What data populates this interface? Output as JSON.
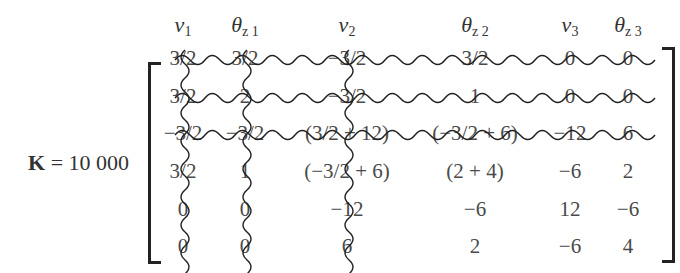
{
  "equation": {
    "lhs_symbol": "K",
    "lhs_equals": " = 10 000",
    "terminator": "."
  },
  "column_headers": [
    {
      "base": "v",
      "sub": "1",
      "x": 183
    },
    {
      "base": "θ",
      "sub": "z 1",
      "x": 245
    },
    {
      "base": "v",
      "sub": "2",
      "x": 347
    },
    {
      "base": "θ",
      "sub": "z 2",
      "x": 475
    },
    {
      "base": "v",
      "sub": "3",
      "x": 570
    },
    {
      "base": "θ",
      "sub": "z 3",
      "x": 628
    }
  ],
  "matrix": {
    "rows": [
      [
        "3/2",
        "3/2",
        "−3/2",
        "3/2",
        "0",
        "0"
      ],
      [
        "3/2",
        "2",
        "−3/2",
        "1",
        "0",
        "0"
      ],
      [
        "−3/2",
        "−3/2",
        "(3/2 + 12)",
        "(−3/2 + 6)",
        "−12",
        "6"
      ],
      [
        "3/2",
        "1",
        "(−3/2 + 6)",
        "(2 + 4)",
        "−6",
        "2"
      ],
      [
        "0",
        "0",
        "−12",
        "−6",
        "12",
        "−6"
      ],
      [
        "0",
        "0",
        "6",
        "2",
        "−6",
        "4"
      ]
    ],
    "row_y": [
      58,
      96,
      133,
      171,
      209,
      246
    ],
    "col_x": [
      183,
      245,
      347,
      475,
      570,
      628
    ],
    "struck_rows": [
      0,
      1,
      2
    ],
    "struck_cols": [
      0,
      1,
      2
    ]
  }
}
